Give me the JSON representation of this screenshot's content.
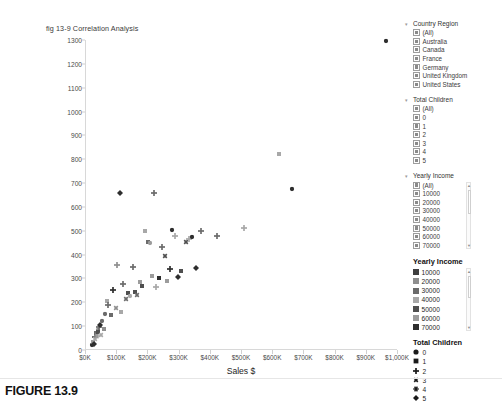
{
  "figure": {
    "caption": "FIGURE 13.9"
  },
  "chart_data": {
    "type": "scatter",
    "title": "fig 13-9 Correlation Analysis",
    "xlabel": "Sales $",
    "ylabel": "",
    "xlim": [
      0,
      1000000
    ],
    "ylim": [
      0,
      1300
    ],
    "grid": false,
    "legend_position": "right",
    "xticks": [
      "$0K",
      "$100K",
      "$200K",
      "$300K",
      "$400K",
      "$500K",
      "$600K",
      "$700K",
      "$800K",
      "$900K",
      "$1,000K"
    ],
    "xtick_values": [
      0,
      100000,
      200000,
      300000,
      400000,
      500000,
      600000,
      700000,
      800000,
      900000,
      1000000
    ],
    "yticks": [
      "0",
      "100",
      "200",
      "300",
      "400",
      "500",
      "600",
      "700",
      "800",
      "900",
      "1000",
      "1100",
      "1200",
      "1300"
    ],
    "ytick_values": [
      0,
      100,
      200,
      300,
      400,
      500,
      600,
      700,
      800,
      900,
      1000,
      1100,
      1200,
      1300
    ],
    "encodings": {
      "color": "Yearly Income",
      "shape": "Total Children"
    },
    "points": [
      {
        "x": 20000,
        "y": 20,
        "children": 0,
        "income": 70000
      },
      {
        "x": 22000,
        "y": 35,
        "children": 1,
        "income": 60000
      },
      {
        "x": 25000,
        "y": 25,
        "children": 5,
        "income": 70000
      },
      {
        "x": 28000,
        "y": 55,
        "children": 2,
        "income": 50000
      },
      {
        "x": 30000,
        "y": 45,
        "children": 3,
        "income": 40000
      },
      {
        "x": 32000,
        "y": 70,
        "children": 1,
        "income": 30000
      },
      {
        "x": 35000,
        "y": 60,
        "children": 4,
        "income": 60000
      },
      {
        "x": 38000,
        "y": 85,
        "children": 0,
        "income": 20000
      },
      {
        "x": 40000,
        "y": 75,
        "children": 1,
        "income": 50000
      },
      {
        "x": 42000,
        "y": 95,
        "children": 2,
        "income": 30000
      },
      {
        "x": 45000,
        "y": 105,
        "children": 5,
        "income": 70000
      },
      {
        "x": 48000,
        "y": 65,
        "children": 3,
        "income": 40000
      },
      {
        "x": 52000,
        "y": 120,
        "children": 0,
        "income": 30000
      },
      {
        "x": 58000,
        "y": 90,
        "children": 1,
        "income": 20000
      },
      {
        "x": 62000,
        "y": 150,
        "children": 0,
        "income": 30000
      },
      {
        "x": 68000,
        "y": 205,
        "children": 1,
        "income": 40000
      },
      {
        "x": 72000,
        "y": 190,
        "children": 2,
        "income": 30000
      },
      {
        "x": 80000,
        "y": 145,
        "children": 1,
        "income": 30000
      },
      {
        "x": 88000,
        "y": 250,
        "children": 2,
        "income": 70000
      },
      {
        "x": 95000,
        "y": 175,
        "children": 3,
        "income": 20000
      },
      {
        "x": 100000,
        "y": 355,
        "children": 2,
        "income": 20000
      },
      {
        "x": 108000,
        "y": 660,
        "children": 5,
        "income": 70000
      },
      {
        "x": 112000,
        "y": 160,
        "children": 1,
        "income": 40000
      },
      {
        "x": 120000,
        "y": 275,
        "children": 2,
        "income": 30000
      },
      {
        "x": 128000,
        "y": 215,
        "children": 3,
        "income": 30000
      },
      {
        "x": 135000,
        "y": 240,
        "children": 1,
        "income": 50000
      },
      {
        "x": 142000,
        "y": 225,
        "children": 0,
        "income": 40000
      },
      {
        "x": 150000,
        "y": 350,
        "children": 2,
        "income": 30000
      },
      {
        "x": 158000,
        "y": 245,
        "children": 1,
        "income": 50000
      },
      {
        "x": 165000,
        "y": 230,
        "children": 3,
        "income": 30000
      },
      {
        "x": 172000,
        "y": 285,
        "children": 1,
        "income": 60000
      },
      {
        "x": 180000,
        "y": 270,
        "children": 1,
        "income": 50000
      },
      {
        "x": 190000,
        "y": 500,
        "children": 1,
        "income": 40000
      },
      {
        "x": 198000,
        "y": 455,
        "children": 1,
        "income": 30000
      },
      {
        "x": 205000,
        "y": 450,
        "children": 0,
        "income": 60000
      },
      {
        "x": 210000,
        "y": 310,
        "children": 1,
        "income": 60000
      },
      {
        "x": 218000,
        "y": 660,
        "children": 2,
        "income": 30000
      },
      {
        "x": 225000,
        "y": 265,
        "children": 2,
        "income": 40000
      },
      {
        "x": 235000,
        "y": 300,
        "children": 1,
        "income": 70000
      },
      {
        "x": 245000,
        "y": 430,
        "children": 2,
        "income": 30000
      },
      {
        "x": 252000,
        "y": 395,
        "children": 3,
        "income": 50000
      },
      {
        "x": 260000,
        "y": 290,
        "children": 1,
        "income": 60000
      },
      {
        "x": 268000,
        "y": 340,
        "children": 2,
        "income": 70000
      },
      {
        "x": 275000,
        "y": 505,
        "children": 0,
        "income": 70000
      },
      {
        "x": 285000,
        "y": 480,
        "children": 2,
        "income": 40000
      },
      {
        "x": 295000,
        "y": 305,
        "children": 5,
        "income": 70000
      },
      {
        "x": 305000,
        "y": 330,
        "children": 1,
        "income": 50000
      },
      {
        "x": 320000,
        "y": 455,
        "children": 3,
        "income": 50000
      },
      {
        "x": 330000,
        "y": 465,
        "children": 2,
        "income": 40000
      },
      {
        "x": 340000,
        "y": 475,
        "children": 0,
        "income": 70000
      },
      {
        "x": 352000,
        "y": 345,
        "children": 5,
        "income": 70000
      },
      {
        "x": 368000,
        "y": 500,
        "children": 2,
        "income": 30000
      },
      {
        "x": 420000,
        "y": 480,
        "children": 2,
        "income": 30000
      },
      {
        "x": 505000,
        "y": 510,
        "children": 2,
        "income": 40000
      },
      {
        "x": 620000,
        "y": 820,
        "children": 1,
        "income": 40000
      },
      {
        "x": 660000,
        "y": 675,
        "children": 0,
        "income": 70000
      },
      {
        "x": 960000,
        "y": 1295,
        "children": 0,
        "income": 70000
      }
    ],
    "series_colors": {
      "10000": "#3f3f3f",
      "20000": "#8f8f8f",
      "30000": "#6b6b6b",
      "40000": "#a8a8a8",
      "50000": "#4f4f4f",
      "60000": "#9c9c9c",
      "70000": "#2e2e2e"
    }
  },
  "filters": [
    {
      "name": "country-region",
      "title": "Country Region",
      "scroll": false,
      "options": [
        {
          "label": "(All)",
          "checked": true
        },
        {
          "label": "Australia",
          "checked": true
        },
        {
          "label": "Canada",
          "checked": true
        },
        {
          "label": "France",
          "checked": true
        },
        {
          "label": "Germany",
          "checked": true
        },
        {
          "label": "United Kingdom",
          "checked": true
        },
        {
          "label": "United States",
          "checked": true
        }
      ]
    },
    {
      "name": "total-children",
      "title": "Total Children",
      "scroll": false,
      "options": [
        {
          "label": "(All)",
          "checked": true
        },
        {
          "label": "0",
          "checked": true
        },
        {
          "label": "1",
          "checked": true
        },
        {
          "label": "2",
          "checked": true
        },
        {
          "label": "3",
          "checked": true
        },
        {
          "label": "4",
          "checked": true
        },
        {
          "label": "5",
          "checked": true
        }
      ]
    },
    {
      "name": "yearly-income",
      "title": "Yearly Income",
      "scroll": true,
      "options": [
        {
          "label": "(All)",
          "checked": true
        },
        {
          "label": "10000",
          "checked": true
        },
        {
          "label": "20000",
          "checked": true
        },
        {
          "label": "30000",
          "checked": true
        },
        {
          "label": "40000",
          "checked": true
        },
        {
          "label": "50000",
          "checked": true
        },
        {
          "label": "60000",
          "checked": true
        },
        {
          "label": "70000",
          "checked": true
        }
      ]
    }
  ],
  "legends": [
    {
      "name": "yearly-income",
      "title": "Yearly Income",
      "kind": "color",
      "scroll": true,
      "items": [
        {
          "label": "10000",
          "color": "#3f3f3f"
        },
        {
          "label": "20000",
          "color": "#8f8f8f"
        },
        {
          "label": "30000",
          "color": "#6b6b6b"
        },
        {
          "label": "40000",
          "color": "#a8a8a8"
        },
        {
          "label": "50000",
          "color": "#4f4f4f"
        },
        {
          "label": "60000",
          "color": "#9c9c9c"
        },
        {
          "label": "70000",
          "color": "#2e2e2e"
        }
      ]
    },
    {
      "name": "total-children",
      "title": "Total Children",
      "kind": "shape",
      "scroll": false,
      "items": [
        {
          "label": "0",
          "shape": "circle"
        },
        {
          "label": "1",
          "shape": "square"
        },
        {
          "label": "2",
          "shape": "plus"
        },
        {
          "label": "3",
          "shape": "cross"
        },
        {
          "label": "4",
          "shape": "star"
        },
        {
          "label": "5",
          "shape": "diamond"
        }
      ]
    }
  ]
}
